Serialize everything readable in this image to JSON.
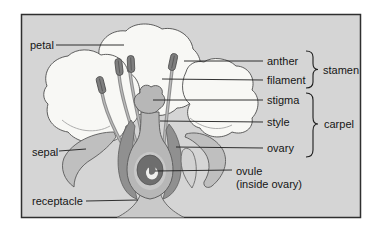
{
  "figure": {
    "type": "flower-anatomy-diagram",
    "panel_bg": "#d5d5d5",
    "panel_border": "#2f2f2f",
    "petal_fill": "#f8f8f5",
    "sepal_fill": "#bfbfbf",
    "stamen_fill": "#7f7f7f",
    "carpel_fill": "#b7b7b7",
    "ovule_fill": "#6e6e6e",
    "leader_line_color": "#1c1c1c",
    "text_color": "#161616"
  },
  "labels": {
    "petal": "petal",
    "anther": "anther",
    "filament": "filament",
    "stamen": "stamen",
    "stigma": "stigma",
    "style": "style",
    "carpel": "carpel",
    "ovary": "ovary",
    "ovule": "ovule",
    "ovule_note": "(inside ovary)",
    "sepal": "sepal",
    "receptacle": "receptacle"
  }
}
